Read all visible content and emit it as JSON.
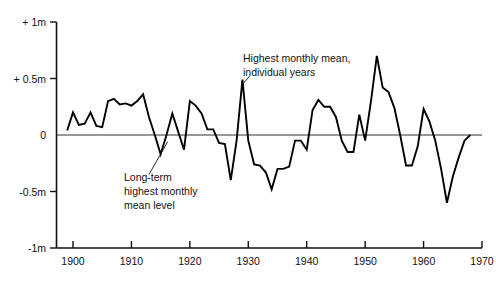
{
  "chart_data": {
    "type": "line",
    "title": "",
    "subtitle": "",
    "xlabel": "",
    "ylabel": "",
    "xlim": [
      1898,
      1970
    ],
    "ylim": [
      -1,
      1
    ],
    "grid": false,
    "legend": "none",
    "y_unit": "m",
    "x_ticks": [
      1900,
      1910,
      1920,
      1930,
      1940,
      1950,
      1960,
      1970
    ],
    "x_tick_labels": [
      "1900",
      "1910",
      "1920",
      "1930",
      "1940",
      "1950",
      "1960",
      "1970"
    ],
    "y_ticks": [
      1,
      0.5,
      0,
      -0.5,
      -1
    ],
    "y_tick_labels": [
      "+ 1m",
      "+ 0.5m",
      "0",
      "-0.5m",
      "-1m"
    ],
    "zero_reference_line": 0,
    "series": [
      {
        "name": "Highest monthly mean, individual years",
        "x": [
          1899,
          1900,
          1901,
          1902,
          1903,
          1904,
          1905,
          1906,
          1907,
          1908,
          1909,
          1910,
          1911,
          1912,
          1913,
          1914,
          1915,
          1916,
          1917,
          1918,
          1919,
          1920,
          1921,
          1922,
          1923,
          1924,
          1925,
          1926,
          1927,
          1928,
          1929,
          1930,
          1931,
          1932,
          1933,
          1934,
          1935,
          1936,
          1937,
          1938,
          1939,
          1940,
          1941,
          1942,
          1943,
          1944,
          1945,
          1946,
          1947,
          1948,
          1949,
          1950,
          1951,
          1952,
          1953,
          1954,
          1955,
          1956,
          1957,
          1958,
          1959,
          1960,
          1961,
          1962,
          1963,
          1964,
          1965,
          1966,
          1967,
          1968
        ],
        "y": [
          0.04,
          0.2,
          0.09,
          0.1,
          0.2,
          0.08,
          0.07,
          0.3,
          0.32,
          0.27,
          0.28,
          0.26,
          0.3,
          0.36,
          0.16,
          0.0,
          -0.17,
          0.0,
          0.19,
          0.03,
          -0.13,
          0.3,
          0.26,
          0.19,
          0.05,
          0.05,
          -0.07,
          -0.08,
          -0.4,
          -0.05,
          0.49,
          -0.05,
          -0.26,
          -0.27,
          -0.33,
          -0.48,
          -0.3,
          -0.3,
          -0.28,
          -0.05,
          -0.05,
          -0.13,
          0.22,
          0.31,
          0.25,
          0.25,
          0.16,
          -0.05,
          -0.15,
          -0.15,
          0.18,
          -0.05,
          0.3,
          0.7,
          0.42,
          0.38,
          0.24,
          0.0,
          -0.27,
          -0.27,
          -0.1,
          0.23,
          0.12,
          -0.05,
          -0.3,
          -0.6,
          -0.37,
          -0.2,
          -0.05,
          0.0
        ]
      }
    ],
    "annotations": [
      {
        "id": "annotation-peak",
        "lines": [
          "Highest monthly mean,",
          "individual years"
        ],
        "text_x": 1930.5,
        "text_y": 0.63,
        "leader_from_x": 1930.2,
        "leader_from_y": 0.52,
        "leader_to_x": 1928.9,
        "leader_to_y": 0.44
      },
      {
        "id": "annotation-longterm",
        "lines": [
          "Long-term",
          "highest monthly",
          "mean level"
        ],
        "text_x": 1910.3,
        "text_y": -0.42,
        "leader_from_x": 1913.0,
        "leader_from_y": -0.35,
        "leader_to_x": 1916.2,
        "leader_to_y": -0.06
      }
    ]
  },
  "figure": {
    "background_color": "#ffffff",
    "line_color": "#000000",
    "axis_color": "#111111",
    "zero_line_color": "#333333"
  }
}
